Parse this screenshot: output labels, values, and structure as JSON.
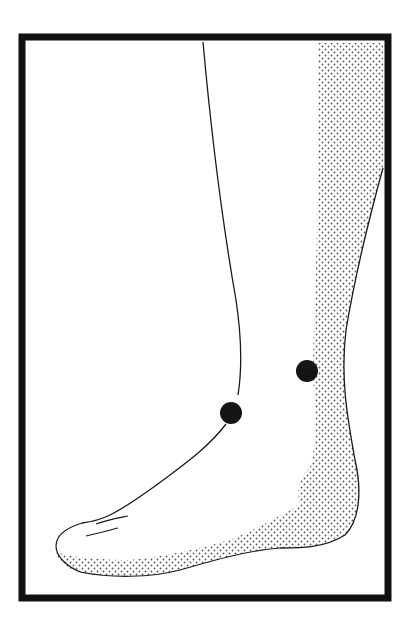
{
  "figure": {
    "frame": {
      "x": 22,
      "y": 37,
      "width": 366,
      "height": 561,
      "border_px": 7,
      "color": "#111111"
    },
    "background": "#ffffff",
    "stipple_color": "#555555",
    "ink_color": "#1a1a1a",
    "markers": [
      {
        "label": "point-1",
        "cx": 231,
        "cy": 413,
        "r": 11,
        "color": "#151515"
      },
      {
        "label": "point-2",
        "cx": 307,
        "cy": 371,
        "r": 11,
        "color": "#151515"
      }
    ]
  }
}
